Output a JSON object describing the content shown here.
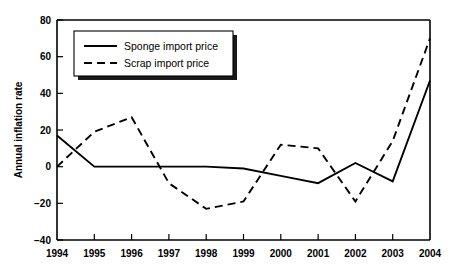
{
  "chart_data": {
    "type": "line",
    "title": "",
    "subtitle": "",
    "xlabel": "",
    "ylabel": "Annual inflation rate",
    "x": [
      1994,
      1995,
      1996,
      1997,
      1998,
      1999,
      2000,
      2001,
      2002,
      2003,
      2004
    ],
    "xtick_labels": [
      "1994",
      "1995",
      "1996",
      "1997",
      "1998",
      "1999",
      "2000",
      "2001",
      "2002",
      "2003",
      "2004"
    ],
    "ytick_labels": [
      "80",
      "60",
      "40",
      "20",
      "0",
      "−20",
      "−40"
    ],
    "yticks": [
      80,
      60,
      40,
      20,
      0,
      -20,
      -40
    ],
    "ylim": [
      -40,
      80
    ],
    "xlim": [
      1994,
      2004
    ],
    "grid": false,
    "legend_position": "upper-left",
    "series": [
      {
        "name": "Sponge import price",
        "style": "solid",
        "color": "#000000",
        "values": [
          17,
          0,
          0,
          0,
          0,
          -1,
          -5,
          -9,
          2,
          -8,
          47
        ]
      },
      {
        "name": "Scrap import price",
        "style": "dashed",
        "color": "#000000",
        "values": [
          0,
          19,
          27,
          -9,
          -23,
          -19,
          12,
          10,
          -19,
          14,
          70
        ]
      }
    ]
  },
  "legend": {
    "entries": [
      {
        "label": "Sponge import price",
        "style": "solid"
      },
      {
        "label": "Scrap import price",
        "style": "dashed"
      }
    ]
  },
  "colors": {
    "background": "#ffffff",
    "ink": "#000000",
    "legend_shadow": "#1a1a1a"
  }
}
